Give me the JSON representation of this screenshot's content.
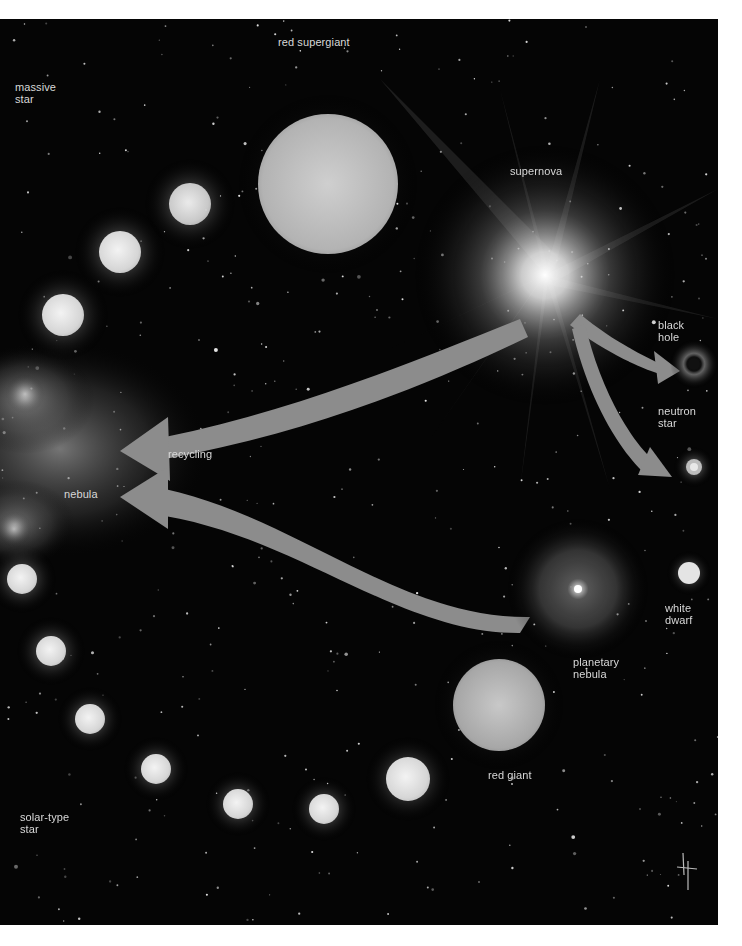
{
  "diagram": {
    "labels": {
      "massive_star": "massive\nstar",
      "red_supergiant": "red supergiant",
      "supernova": "supernova",
      "black_hole": "black\nhole",
      "neutron_star": "neutron\nstar",
      "recycling": "recycling",
      "nebula": "nebula",
      "white_dwarf": "white\ndwarf",
      "planetary_nebula": "planetary\nnebula",
      "red_giant": "red giant",
      "solar_type_star": "solar-type\nstar"
    },
    "nodes": [
      {
        "id": "massive-star-1",
        "x": 190,
        "y": 185,
        "r": 21
      },
      {
        "id": "massive-star-2",
        "x": 120,
        "y": 233,
        "r": 21
      },
      {
        "id": "massive-star-3",
        "x": 63,
        "y": 296,
        "r": 21
      },
      {
        "id": "red-supergiant",
        "x": 328,
        "y": 165,
        "r": 70
      },
      {
        "id": "supernova",
        "x": 545,
        "y": 256,
        "r": 30
      },
      {
        "id": "black-hole",
        "x": 694,
        "y": 345,
        "r": 6
      },
      {
        "id": "neutron-star",
        "x": 694,
        "y": 448,
        "r": 8
      },
      {
        "id": "nebula-left",
        "x": 20,
        "y": 430,
        "r": 50
      },
      {
        "id": "planetary-nebula",
        "x": 578,
        "y": 570,
        "r": 60
      },
      {
        "id": "white-dwarf",
        "x": 689,
        "y": 554,
        "r": 12
      },
      {
        "id": "red-giant",
        "x": 499,
        "y": 686,
        "r": 46
      },
      {
        "id": "solar-star-1",
        "x": 408,
        "y": 760,
        "r": 22
      },
      {
        "id": "solar-star-2",
        "x": 324,
        "y": 790,
        "r": 15
      },
      {
        "id": "solar-star-3",
        "x": 238,
        "y": 785,
        "r": 15
      },
      {
        "id": "solar-star-4",
        "x": 156,
        "y": 750,
        "r": 15
      },
      {
        "id": "solar-star-5",
        "x": 90,
        "y": 700,
        "r": 15
      },
      {
        "id": "solar-star-6",
        "x": 51,
        "y": 632,
        "r": 15
      },
      {
        "id": "solar-star-7",
        "x": 22,
        "y": 560,
        "r": 15
      }
    ],
    "arrows": [
      {
        "id": "recycling-arrow-supernova",
        "from": "supernova",
        "to": "nebula",
        "label": "recycling"
      },
      {
        "id": "recycling-arrow-planetary",
        "from": "planetary-nebula",
        "to": "nebula"
      },
      {
        "id": "arrow-to-black-hole",
        "from": "supernova",
        "to": "black-hole"
      },
      {
        "id": "arrow-to-neutron-star",
        "from": "supernova",
        "to": "neutron-star"
      }
    ],
    "colors": {
      "background": "#050505",
      "star": "#e6e6e6",
      "arrow": "#8a8a8a",
      "label": "#d8d8d8"
    }
  }
}
